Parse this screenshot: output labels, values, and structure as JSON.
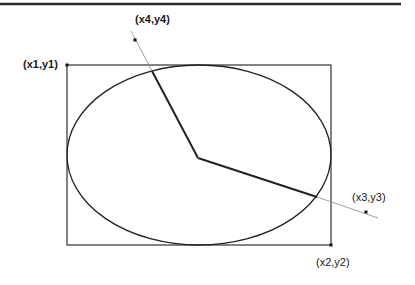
{
  "diagram": {
    "type": "ellipse-arc-construction",
    "top_rule": {
      "x1": 0,
      "x2": 401,
      "y": 4,
      "color": "#2a2a2a"
    },
    "bounding_rect": {
      "x1": 67,
      "y1": 65,
      "x2": 331,
      "y2": 245,
      "stroke": "#333333"
    },
    "ellipse": {
      "cx": 199,
      "cy": 155,
      "rx": 132,
      "ry": 90,
      "stroke": "#222222"
    },
    "center": {
      "x": 198,
      "y": 158
    },
    "radial_lines": [
      {
        "name": "start-radius",
        "x1": 198,
        "y1": 158,
        "x2": 152,
        "y2": 71
      },
      {
        "name": "end-radius",
        "x1": 198,
        "y1": 158,
        "x2": 317,
        "y2": 197
      }
    ],
    "guide_lines": [
      {
        "name": "start-guide",
        "x1": 152,
        "y1": 71,
        "x2": 131,
        "y2": 31
      },
      {
        "name": "end-guide",
        "x1": 317,
        "y1": 197,
        "x2": 378,
        "y2": 218
      }
    ],
    "points": {
      "p1": {
        "x": 67,
        "y": 65,
        "label": "(x1,y1)"
      },
      "p2": {
        "x": 331,
        "y": 245,
        "label": "(x2,y2)"
      },
      "p3": {
        "x": 366,
        "y": 212,
        "label": "(x3,y3)"
      },
      "p4": {
        "x": 135,
        "y": 40,
        "label": "(x4,y4)"
      }
    }
  },
  "labels": {
    "p1": "(x1,y1)",
    "p2": "(x2,y2)",
    "p3": "(x3,y3)",
    "p4": "(x4,y4)"
  }
}
